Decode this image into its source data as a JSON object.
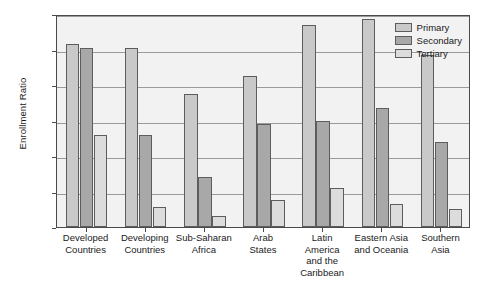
{
  "chart_data": {
    "type": "bar",
    "title": "",
    "xlabel": "",
    "ylabel": "Enrollment Ratio",
    "ylim": [
      0,
      120
    ],
    "yticks": [
      0,
      20,
      40,
      60,
      80,
      100,
      120
    ],
    "grid": true,
    "legend_position": "top-right-inside",
    "categories": [
      "Developed Countries",
      "Developing Countries",
      "Sub-Saharan Africa",
      "Arab States",
      "Latin America and the Caribbean",
      "Eastern Asia and Oceania",
      "Southern Asia"
    ],
    "category_lines": [
      [
        "Developed",
        "Countries"
      ],
      [
        "Developing",
        "Countries"
      ],
      [
        "Sub-Saharan",
        "Africa"
      ],
      [
        "Arab",
        "States"
      ],
      [
        "Latin",
        "America",
        "and the",
        "Caribbean"
      ],
      [
        "Eastern Asia",
        "and Oceania"
      ],
      [
        "Southern",
        "Asia"
      ]
    ],
    "series": [
      {
        "name": "Primary",
        "color": "#c9c9c9",
        "values": [
          103,
          101,
          75,
          85,
          114,
          117,
          97
        ]
      },
      {
        "name": "Secondary",
        "color": "#a8a8a8",
        "values": [
          101,
          52,
          28,
          58,
          60,
          67,
          48
        ]
      },
      {
        "name": "Tertiary",
        "color": "#dcdcdc",
        "values": [
          52,
          11,
          6,
          15,
          22,
          13,
          10
        ]
      }
    ]
  },
  "legend": {
    "items": [
      {
        "label": "Primary"
      },
      {
        "label": "Secondary"
      },
      {
        "label": "Tertiary"
      }
    ]
  },
  "axis": {
    "y_title": "Enrollment Ratio",
    "y_ticks": [
      "0",
      "20",
      "40",
      "60",
      "80",
      "100",
      "120"
    ]
  }
}
